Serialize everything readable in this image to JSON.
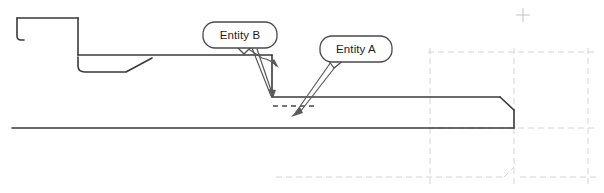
{
  "drawing": {
    "title": "Sheet metal profile section view with entity callouts",
    "background_color": "#ffffff",
    "canvas": {
      "width": 604,
      "height": 193
    },
    "profile": {
      "name": "part-profile-outline",
      "stroke_color": "#3a3a3a",
      "stroke_width": 1.6,
      "description": "Stepped sheet metal cross-section with pocket, ramp and chamfered right end"
    },
    "hidden_edge": {
      "name": "hidden-edge-dashed",
      "stroke_color": "#4a4a4a",
      "stroke_width": 1.5,
      "dash": "5,4"
    },
    "construction_grid": {
      "name": "construction-grid",
      "stroke_color": "#cfcfcf",
      "stroke_width": 0.9,
      "dash": "6,4",
      "vertical_x": [
        430,
        514,
        588
      ],
      "horizontal_y": [
        52,
        128,
        177
      ]
    },
    "origin_marker": {
      "name": "origin-cross-marker",
      "x": 523,
      "y": 15,
      "size": 7,
      "color": "#c8c8c8"
    }
  },
  "callouts": [
    {
      "id": "entity-b",
      "label": "Entity B",
      "bubble": {
        "x": 203,
        "y": 22,
        "width": 74,
        "height": 26,
        "radius": 12
      },
      "text_x": 240,
      "text_y": 35,
      "stroke_color": "#4a4a4a",
      "fill_color": "#ffffff",
      "leader_count": 2,
      "arrow_targets": [
        {
          "x": 279,
          "y": 66
        },
        {
          "x": 272,
          "y": 97
        }
      ]
    },
    {
      "id": "entity-a",
      "label": "Entity A",
      "bubble": {
        "x": 320,
        "y": 36,
        "width": 72,
        "height": 26,
        "radius": 12
      },
      "text_x": 356,
      "text_y": 49,
      "stroke_color": "#4a4a4a",
      "fill_color": "#ffffff",
      "leader_count": 2,
      "arrow_targets": [
        {
          "x": 293,
          "y": 114
        },
        {
          "x": 300,
          "y": 100
        }
      ]
    }
  ],
  "geometry": {
    "top_edge_y": 18,
    "upper_shelf_y": 55,
    "step_edge_y": 97,
    "base_line_y": 128,
    "left_start_x": 12,
    "right_end_x": 514,
    "chamfer_x": 500,
    "hidden_segment": {
      "x1": 273,
      "y1": 106,
      "x2": 314,
      "y2": 106
    }
  }
}
